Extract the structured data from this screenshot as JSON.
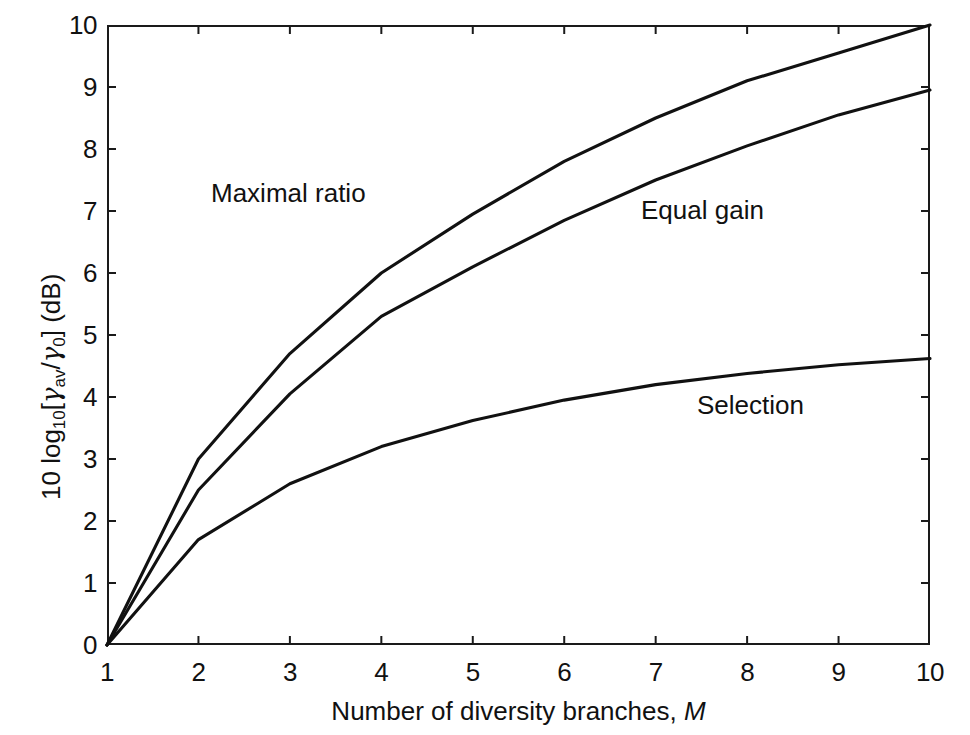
{
  "chart_data": {
    "type": "line",
    "title": "",
    "subtitle": "",
    "xlabel": "Number of diversity branches, M",
    "ylabel": "10 log10[gamma_av/gamma_0] (dB)",
    "xlim": [
      1,
      10
    ],
    "ylim": [
      0,
      10
    ],
    "xticks": [
      "1",
      "2",
      "3",
      "4",
      "5",
      "6",
      "7",
      "8",
      "9",
      "10"
    ],
    "yticks": [
      "0",
      "1",
      "2",
      "3",
      "4",
      "5",
      "6",
      "7",
      "8",
      "9",
      "10"
    ],
    "grid": false,
    "legend": "inline-annotations",
    "x": [
      1,
      2,
      3,
      4,
      5,
      6,
      7,
      8,
      9,
      10
    ],
    "series": [
      {
        "name": "Maximal ratio",
        "values": [
          0.0,
          3.0,
          4.7,
          6.0,
          6.95,
          7.8,
          8.5,
          9.1,
          9.55,
          10.0
        ],
        "color": "#111111"
      },
      {
        "name": "Equal gain",
        "values": [
          0.0,
          2.5,
          4.05,
          5.3,
          6.1,
          6.85,
          7.5,
          8.05,
          8.55,
          8.95
        ],
        "color": "#111111"
      },
      {
        "name": "Selection",
        "values": [
          0.0,
          1.7,
          2.6,
          3.2,
          3.62,
          3.95,
          4.2,
          4.38,
          4.52,
          4.62
        ],
        "color": "#111111"
      }
    ],
    "annotations": [
      {
        "text": "Maximal ratio",
        "x": 2.15,
        "y": 7.45
      },
      {
        "text": "Equal gain",
        "x": 6.85,
        "y": 7.2
      },
      {
        "text": "Selection",
        "x": 7.45,
        "y": 4.05
      }
    ]
  },
  "axis": {
    "x_title_prefix": "Number of diversity branches, ",
    "x_title_symbol": "M",
    "y_title_lead": "10 log",
    "y_title_sub1": "10",
    "y_title_open": "[",
    "y_title_gamma1": "γ",
    "y_title_sub2": "av",
    "y_title_slash": "/",
    "y_title_gamma2": "γ",
    "y_title_sub3": "0",
    "y_title_close": "] (dB)"
  },
  "labels": {
    "maximal_ratio": "Maximal ratio",
    "equal_gain": "Equal gain",
    "selection": "Selection"
  },
  "colors": {
    "axis": "#1a1a1a",
    "curve": "#111111",
    "background": "#ffffff"
  }
}
